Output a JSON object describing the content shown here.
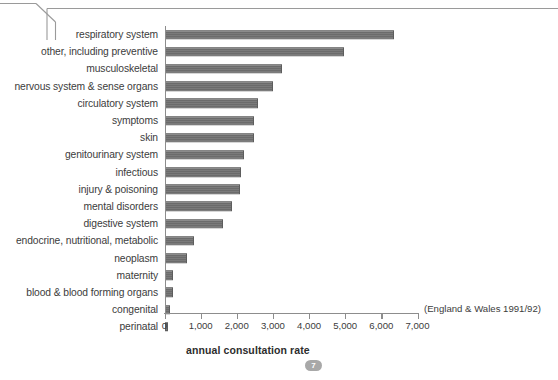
{
  "page": {
    "badge_number": "7"
  },
  "chart_data": {
    "type": "bar",
    "orientation": "horizontal",
    "title": "",
    "xlabel": "annual consultation rate",
    "ylabel": "",
    "annotation": "(England & Wales 1991/92)",
    "xlim": [
      0,
      7000
    ],
    "grid": false,
    "legend": null,
    "tick_labels": [
      "0",
      "1,000",
      "2,000",
      "3,000",
      "4,000",
      "5,000",
      "6,000",
      "7,000"
    ],
    "ticks": [
      0,
      1000,
      2000,
      3000,
      4000,
      5000,
      6000,
      7000
    ],
    "categories": [
      "respiratory system",
      "other, including preventive",
      "musculoskeletal",
      "nervous system & sense organs",
      "circulatory system",
      "symptoms",
      "skin",
      "genitourinary system",
      "infectious",
      "injury & poisoning",
      "mental disorders",
      "digestive system",
      "endocrine, nutritional, metabolic",
      "neoplasm",
      "maternity",
      "blood & blood forming organs",
      "congenital",
      "perinatal"
    ],
    "values": [
      6330,
      4950,
      3250,
      3000,
      2560,
      2470,
      2450,
      2180,
      2110,
      2080,
      1860,
      1610,
      800,
      600,
      220,
      210,
      130,
      90
    ],
    "bar_color": "#6e6e6e",
    "axis_color": "#8d8d8d"
  }
}
